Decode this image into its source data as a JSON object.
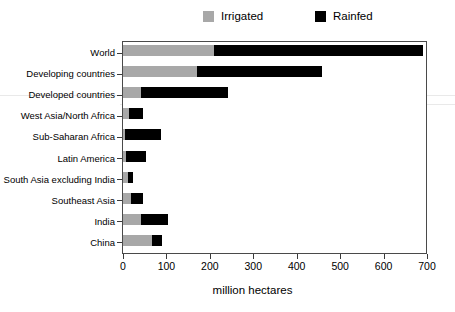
{
  "chart_data": {
    "type": "bar",
    "orientation": "horizontal",
    "stacked": true,
    "title": "",
    "xlabel": "million hectares",
    "ylabel": "",
    "xlim": [
      0,
      700
    ],
    "xticks": [
      0,
      100,
      200,
      300,
      400,
      500,
      600,
      700
    ],
    "grid": false,
    "legend_position": "top",
    "categories": [
      "World",
      "Developing countries",
      "Developed countries",
      "West Asia/North Africa",
      "Sub-Saharan Africa",
      "Latin America",
      "South Asia excluding India",
      "Southeast Asia",
      "India",
      "China"
    ],
    "series": [
      {
        "name": "Irrigated",
        "color": "#a8a8a8",
        "values": [
          209,
          170,
          41,
          14,
          5,
          8,
          12,
          18,
          41,
          67
        ]
      },
      {
        "name": "Rainfed",
        "color": "#000000",
        "values": [
          482,
          289,
          200,
          32,
          82,
          45,
          11,
          28,
          62,
          23
        ]
      }
    ],
    "totals": [
      691,
      459,
      241,
      46,
      87,
      53,
      23,
      46,
      103,
      90
    ]
  },
  "legend": {
    "entries": [
      {
        "label": "Irrigated",
        "color": "#a8a8a8"
      },
      {
        "label": "Rainfed",
        "color": "#000000"
      }
    ]
  },
  "axis": {
    "x_title": "million hectares",
    "tick_labels": [
      "0",
      "100",
      "200",
      "300",
      "400",
      "500",
      "600",
      "700"
    ]
  }
}
